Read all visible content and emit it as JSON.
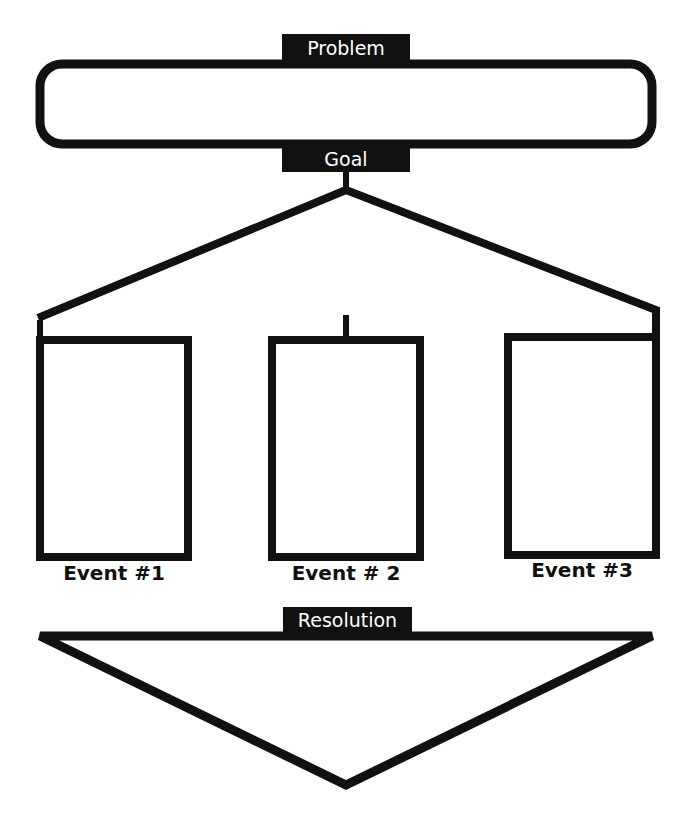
{
  "diagram": {
    "type": "story-map",
    "colors": {
      "stroke": "#111111",
      "background": "#ffffff",
      "label_text": "#ffffff"
    },
    "problem": {
      "label": "Problem"
    },
    "goal": {
      "label": "Goal"
    },
    "events": [
      {
        "label": "Event #1"
      },
      {
        "label": "Event # 2"
      },
      {
        "label": "Event #3"
      }
    ],
    "resolution": {
      "label": "Resolution"
    }
  }
}
